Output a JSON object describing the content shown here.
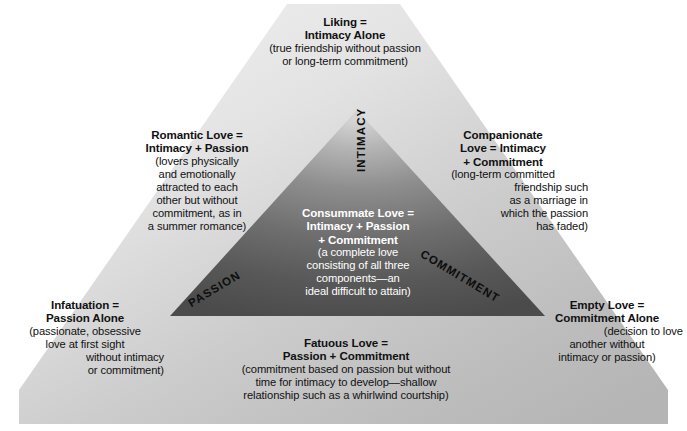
{
  "diagram": {
    "outer_fill_light": "#e9e9e9",
    "outer_fill_dark": "#b9b9b9",
    "inner_fill_light": "#b4b4b4",
    "inner_fill_dark": "#4a4a4a",
    "background": "#ffffff"
  },
  "axes": {
    "intimacy": "INTIMACY",
    "passion": "PASSION",
    "commitment": "COMMITMENT"
  },
  "labels": {
    "liking": {
      "heading_line1": "Liking =",
      "heading_line2": "Intimacy Alone",
      "body_line1": "(true friendship without passion",
      "body_line2": "or long-term commitment)"
    },
    "romantic": {
      "heading_line1": "Romantic Love =",
      "heading_line2": "Intimacy + Passion",
      "body_line1": "(lovers physically",
      "body_line2": "and emotionally",
      "body_line3": "attracted to each",
      "body_line4": "other but without",
      "body_line5": "commitment, as in",
      "body_line6": "a summer romance)"
    },
    "companionate": {
      "heading_line1": "Companionate",
      "heading_line2": "Love = Intimacy",
      "heading_line3": "+ Commitment",
      "body_line1": "(long-term committed",
      "body_line2": "friendship such",
      "body_line3": "as a marriage in",
      "body_line4": "which the passion",
      "body_line5": "has faded)"
    },
    "consummate": {
      "heading_line1": "Consummate Love =",
      "heading_line2": "Intimacy + Passion",
      "heading_line3": "+ Commitment",
      "body_line1": "(a complete love",
      "body_line2": "consisting of all three",
      "body_line3": "components—an",
      "body_line4": "ideal difficult to attain)"
    },
    "infatuation": {
      "heading_line1": "Infatuation =",
      "heading_line2": "Passion Alone",
      "body_line1": "(passionate, obsessive",
      "body_line2": "love at first sight",
      "body_line3": "without intimacy",
      "body_line4": "or commitment)"
    },
    "empty": {
      "heading_line1": "Empty Love =",
      "heading_line2": "Commitment Alone",
      "body_line1": "(decision to love",
      "body_line2": "another without",
      "body_line3": "intimacy or passion)"
    },
    "fatuous": {
      "heading_line1": "Fatuous Love =",
      "heading_line2": "Passion + Commitment",
      "body_line1": "(commitment based on passion but without",
      "body_line2": "time for intimacy to develop—shallow",
      "body_line3": "relationship such as a whirlwind courtship)"
    }
  }
}
